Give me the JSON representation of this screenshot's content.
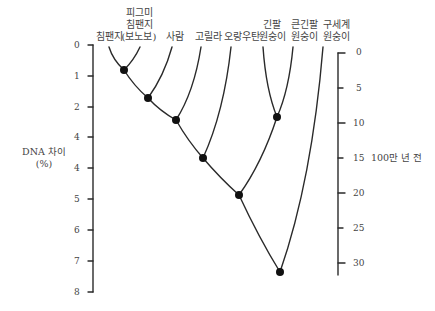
{
  "diagram": {
    "type": "phylogenetic-tree",
    "taxa": [
      {
        "lines": [
          "",
          "",
          "침팬지"
        ]
      },
      {
        "lines": [
          "피그미",
          "침팬지",
          "(보노보)"
        ]
      },
      {
        "lines": [
          "",
          "",
          "사람"
        ]
      },
      {
        "lines": [
          "",
          "",
          "고릴라"
        ]
      },
      {
        "lines": [
          "",
          "",
          "오랑우탄"
        ]
      },
      {
        "lines": [
          "",
          "긴팔",
          "원숭이"
        ]
      },
      {
        "lines": [
          "",
          "큰긴팔",
          "원숭이"
        ]
      },
      {
        "lines": [
          "",
          "구세계",
          "원숭이"
        ]
      }
    ],
    "left_axis": {
      "title_line1": "DNA 차이",
      "title_line2": "(%)",
      "ticks": [
        "0",
        "1",
        "2",
        "4",
        "4",
        "5",
        "6",
        "7",
        "8"
      ]
    },
    "right_axis": {
      "title": "100만 년 전",
      "ticks": [
        "0",
        "5",
        "10",
        "15",
        "20",
        "25",
        "30"
      ]
    },
    "nodes": [
      {
        "joins": "침팬지 + 보노보",
        "dna_diff": 0.7
      },
      {
        "joins": "+ 사람",
        "dna_diff": 1.6
      },
      {
        "joins": "+ 고릴라",
        "dna_diff": 2.3
      },
      {
        "joins": "+ 오랑우탄",
        "dna_diff": 3.6
      },
      {
        "joins": "긴팔원숭이 + 큰긴팔원숭이",
        "dna_diff": 2.3
      },
      {
        "joins": "대형 유인원 + 긴팔원숭이류",
        "dna_diff": 4.8
      },
      {
        "joins": "+ 구세계원숭이",
        "dna_diff": 7.3
      }
    ]
  }
}
